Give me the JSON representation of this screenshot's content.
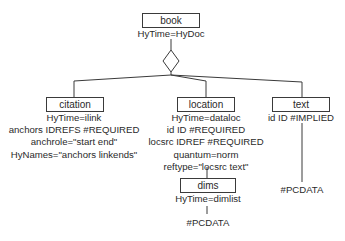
{
  "diagram": {
    "type": "SGML element tree",
    "root": {
      "name": "book",
      "attributes": [
        "HyTime=HyDoc"
      ],
      "connector": "choice-diamond"
    },
    "children": [
      {
        "name": "citation",
        "attributes": [
          "HyTime=ilink",
          "anchors IDREFS #REQUIRED",
          "anchrole=\"start end\"",
          "HyNames=\"anchors linkends\""
        ]
      },
      {
        "name": "location",
        "attributes": [
          "HyTime=dataloc",
          "id ID #REQUIRED",
          "locsrc IDREF #REQUIRED",
          "quantum=norm",
          "reftype=\"locsrc text\""
        ],
        "child": {
          "name": "dims",
          "attributes": [
            "HyTime=dimlist"
          ],
          "content": "#PCDATA"
        }
      },
      {
        "name": "text",
        "attributes": [
          "id ID #IMPLIED"
        ],
        "content": "#PCDATA"
      }
    ]
  },
  "colors": {
    "line": "#3a3a3a",
    "text": "#2a2a2a",
    "background": "#ffffff"
  }
}
